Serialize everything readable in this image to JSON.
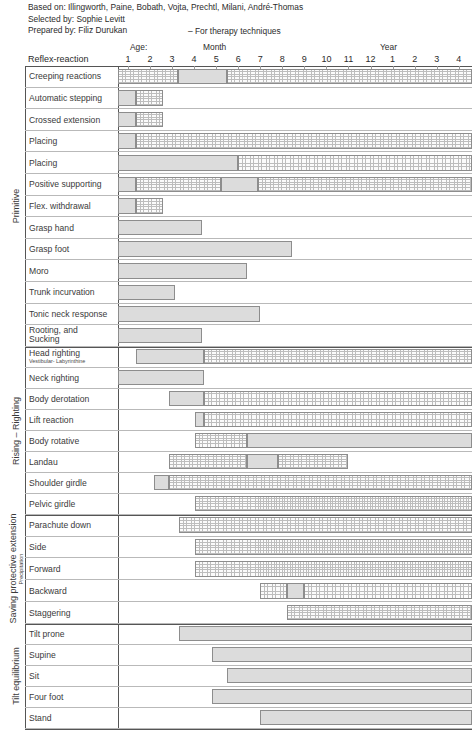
{
  "credits": {
    "based_on": "Based on: Illingworth, Paine, Bobath, Vojta, Prechtl, Milani, André-Thomas",
    "selected_by": "Selected by: Sophie Levitt",
    "prepared_by": "Prepared by: Filiz Durukan",
    "therapy_note": "– For therapy techniques"
  },
  "axis": {
    "corner_label": "Reflex-reaction",
    "age_label": "Age:",
    "month_label": "Month",
    "year_label": "Year",
    "ticks": [
      "1",
      "2",
      "3",
      "4",
      "5",
      "6",
      "7",
      "8",
      "9",
      "10",
      "11",
      "12",
      "1",
      "2",
      "3",
      "4"
    ]
  },
  "legend": {
    "solid_meaning": "appearing / emerging",
    "stippled_meaning": "established / present"
  },
  "colors": {
    "solid_fill": "#dcdcdc",
    "stipple_dot": "#bdbdbd",
    "bar_border": "#8d8d8d",
    "frame_line": "#555555",
    "text": "#3a3a3a",
    "background": "#ffffff"
  },
  "chart_data": {
    "type": "bar",
    "xlabel": "Age (Month 1–12, Year 1–4)",
    "ylabel": "Reflex-reaction",
    "grid": true,
    "legend_position": "none",
    "x_tick_labels": [
      "1",
      "2",
      "3",
      "4",
      "5",
      "6",
      "7",
      "8",
      "9",
      "10",
      "11",
      "12",
      "1",
      "2",
      "3",
      "4"
    ],
    "x_tick_units": [
      "month",
      "month",
      "month",
      "month",
      "month",
      "month",
      "month",
      "month",
      "month",
      "month",
      "month",
      "month",
      "year",
      "year",
      "year",
      "year"
    ],
    "xlim_units": [
      0.55,
      16.6
    ],
    "note": "Bar spans are given in tick-index units where index 1..12 = months 1..12 and index 13..16 = years 1..4. Each row may carry a 'solid' (emerging) segment and a 'stippled' (established) segment.",
    "groups": [
      {
        "name": "Primitive",
        "rows": [
          {
            "label": "Creeping reactions",
            "segments": [
              {
                "style": "stippled",
                "start": 0.55,
                "end": 3.25
              },
              {
                "style": "solid",
                "start": 3.25,
                "end": 5.5
              },
              {
                "style": "stippled",
                "start": 5.5,
                "end": 16.6
              }
            ]
          },
          {
            "label": "Automatic stepping",
            "segments": [
              {
                "style": "solid",
                "start": 0.55,
                "end": 1.35
              },
              {
                "style": "stippled",
                "start": 1.35,
                "end": 2.6
              }
            ]
          },
          {
            "label": "Crossed extension",
            "segments": [
              {
                "style": "solid",
                "start": 0.55,
                "end": 1.35
              },
              {
                "style": "stippled",
                "start": 1.35,
                "end": 2.6
              }
            ]
          },
          {
            "label": "Placing",
            "sublabel": "Arms",
            "segments": [
              {
                "style": "solid",
                "start": 0.55,
                "end": 1.35
              },
              {
                "style": "stippled",
                "start": 1.35,
                "end": 16.6
              }
            ]
          },
          {
            "label": "Placing",
            "sublabel": "Legs",
            "segments": [
              {
                "style": "solid",
                "start": 0.55,
                "end": 6.0
              },
              {
                "style": "stippled",
                "start": 6.0,
                "end": 16.6
              }
            ]
          },
          {
            "label": "Positive supporting",
            "segments": [
              {
                "style": "solid",
                "start": 0.55,
                "end": 1.35
              },
              {
                "style": "stippled",
                "start": 1.35,
                "end": 5.2
              },
              {
                "style": "solid",
                "start": 5.2,
                "end": 6.9
              },
              {
                "style": "stippled",
                "start": 6.9,
                "end": 16.6
              }
            ]
          },
          {
            "label": "Flex. withdrawal",
            "segments": [
              {
                "style": "solid",
                "start": 0.55,
                "end": 1.35
              },
              {
                "style": "stippled",
                "start": 1.35,
                "end": 2.6
              }
            ]
          },
          {
            "label": "Grasp hand",
            "segments": [
              {
                "style": "solid",
                "start": 0.55,
                "end": 4.35
              }
            ]
          },
          {
            "label": "Grasp foot",
            "segments": [
              {
                "style": "solid",
                "start": 0.55,
                "end": 8.45
              }
            ]
          },
          {
            "label": "Moro",
            "segments": [
              {
                "style": "solid",
                "start": 0.55,
                "end": 6.4
              }
            ]
          },
          {
            "label": "Trunk incurvation",
            "segments": [
              {
                "style": "solid",
                "start": 0.55,
                "end": 3.15
              }
            ]
          },
          {
            "label": "Tonic neck response",
            "segments": [
              {
                "style": "solid",
                "start": 0.55,
                "end": 7.0
              }
            ]
          },
          {
            "label": "Rooting, and",
            "label2": "Sucking",
            "segments": [
              {
                "style": "solid",
                "start": 0.55,
                "end": 4.35
              }
            ]
          }
        ]
      },
      {
        "name": "Rising – Righting",
        "rows": [
          {
            "label": "Head righting",
            "sub": "Vestibular- Labyrinthine",
            "segments": [
              {
                "style": "solid",
                "start": 1.35,
                "end": 4.45
              },
              {
                "style": "stippled",
                "start": 4.45,
                "end": 16.6
              }
            ]
          },
          {
            "label": "Neck righting",
            "segments": [
              {
                "style": "solid",
                "start": 0.55,
                "end": 4.45
              }
            ]
          },
          {
            "label": "Body derotation",
            "segments": [
              {
                "style": "solid",
                "start": 2.85,
                "end": 4.45
              },
              {
                "style": "stippled",
                "start": 4.45,
                "end": 16.6
              }
            ]
          },
          {
            "label": "Lift reaction",
            "segments": [
              {
                "style": "solid",
                "start": 4.05,
                "end": 4.45
              },
              {
                "style": "stippled",
                "start": 4.45,
                "end": 16.6
              }
            ]
          },
          {
            "label": "Body rotative",
            "segments": [
              {
                "style": "stippled",
                "start": 4.05,
                "end": 6.4
              },
              {
                "style": "solid",
                "start": 6.4,
                "end": 16.6
              }
            ]
          },
          {
            "label": "Landau",
            "segments": [
              {
                "style": "stippled",
                "start": 2.85,
                "end": 6.4
              },
              {
                "style": "solid",
                "start": 6.4,
                "end": 7.8
              },
              {
                "style": "stippled",
                "start": 7.8,
                "end": 11.0
              }
            ]
          },
          {
            "label": "Shoulder girdle",
            "segments": [
              {
                "style": "solid",
                "start": 2.2,
                "end": 2.85
              },
              {
                "style": "stippled",
                "start": 2.85,
                "end": 16.6
              }
            ]
          },
          {
            "label": "Pelvic girdle",
            "segments": [
              {
                "style": "stippled",
                "start": 4.05,
                "end": 16.6
              }
            ]
          }
        ]
      },
      {
        "name": "Saving protective extension",
        "subname": "Precipitation",
        "rows": [
          {
            "label": "Parachute down",
            "segments": [
              {
                "style": "stippled",
                "start": 3.3,
                "end": 16.6
              }
            ]
          },
          {
            "label": "Side",
            "segments": [
              {
                "style": "stippled",
                "start": 4.05,
                "end": 16.6
              }
            ]
          },
          {
            "label": "Forward",
            "segments": [
              {
                "style": "stippled",
                "start": 4.05,
                "end": 16.6
              }
            ]
          },
          {
            "label": "Backward",
            "segments": [
              {
                "style": "stippled",
                "start": 7.0,
                "end": 8.2
              },
              {
                "style": "solid",
                "start": 8.2,
                "end": 9.0
              },
              {
                "style": "stippled",
                "start": 9.0,
                "end": 16.6
              }
            ]
          },
          {
            "label": "Staggering",
            "tri": [
              "Lateral",
              "Anterior",
              "Posterior"
            ],
            "segments": [
              {
                "style": "stippled",
                "start": 8.2,
                "end": 16.6
              }
            ]
          }
        ]
      },
      {
        "name": "Tilt equilibrium",
        "rows": [
          {
            "label": "Tilt prone",
            "segments": [
              {
                "style": "solid",
                "start": 3.3,
                "end": 16.6
              }
            ]
          },
          {
            "label": "Supine",
            "segments": [
              {
                "style": "solid",
                "start": 4.8,
                "end": 16.6
              }
            ]
          },
          {
            "label": "Sit",
            "segments": [
              {
                "style": "solid",
                "start": 5.5,
                "end": 16.6
              }
            ]
          },
          {
            "label": "Four foot",
            "segments": [
              {
                "style": "solid",
                "start": 4.8,
                "end": 16.6
              }
            ]
          },
          {
            "label": "Stand",
            "segments": [
              {
                "style": "solid",
                "start": 7.0,
                "end": 16.6
              }
            ]
          }
        ]
      }
    ]
  }
}
